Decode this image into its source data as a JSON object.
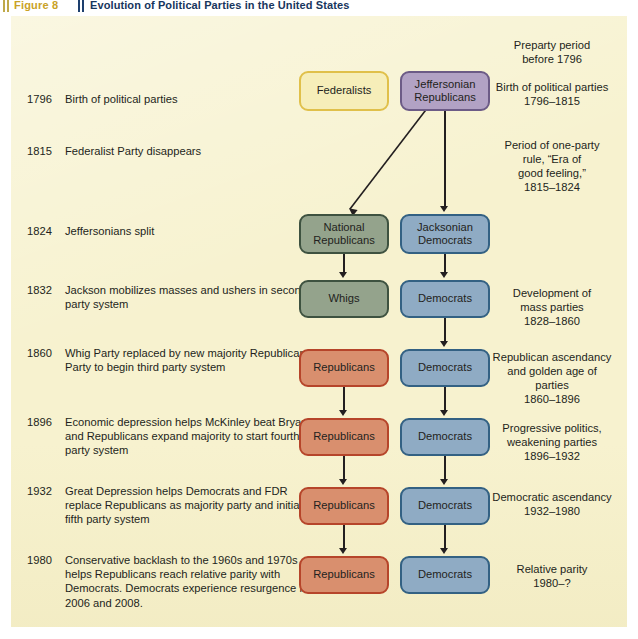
{
  "header": {
    "figure_label": "Figure 8",
    "title": "Evolution of Political Parties in the United States",
    "label_color": "#c9a227",
    "title_color": "#17365d"
  },
  "colors": {
    "canvas": "#f7f2cf",
    "federalists_fill": "#f6eeb9",
    "federalists_border": "#e0c04a",
    "jeffersonian_fill": "#b2a2c4",
    "jeffersonian_border": "#6c5b86",
    "green_fill": "#94a38c",
    "green_border": "#3e5240",
    "blue_fill": "#8fabc4",
    "blue_border": "#336183",
    "red_fill": "#d98f6e",
    "red_border": "#b6452a",
    "text": "#231f20"
  },
  "timeline": [
    {
      "year": "1796",
      "text": "Birth of political parties"
    },
    {
      "year": "1815",
      "text": "Federalist Party disappears"
    },
    {
      "year": "1824",
      "text": "Jeffersonians split"
    },
    {
      "year": "1832",
      "text": "Jackson mobilizes masses and ushers in second party system"
    },
    {
      "year": "1860",
      "text": "Whig Party replaced by new majority Republican Party to begin third party system"
    },
    {
      "year": "1896",
      "text": "Economic depression helps McKinley beat Bryan, and Republicans expand majority to start fourth party system"
    },
    {
      "year": "1932",
      "text": "Great Depression helps Democrats and FDR replace Republicans as majority party and initiates fifth party system"
    },
    {
      "year": "1980",
      "text": "Conservative backlash to the 1960s and 1970s helps Republicans reach relative parity with Democrats. Democrats experience resurgence in 2006 and 2008."
    }
  ],
  "annotations": [
    {
      "text": "Preparty period\nbefore 1796"
    },
    {
      "text": "Birth of political parties\n1796–1815"
    },
    {
      "text": "Period of one-party\nrule, “Era of\ngood feeling,”\n1815–1824"
    },
    {
      "text": "Development of\nmass parties\n1828–1860"
    },
    {
      "text": "Republican ascendancy\nand golden age of\nparties\n1860–1896"
    },
    {
      "text": "Progressive politics,\nweakening parties\n1896–1932"
    },
    {
      "text": "Democratic ascendancy\n1932–1980"
    },
    {
      "text": "Relative parity\n1980–?"
    }
  ],
  "boxes": {
    "federalists": "Federalists",
    "jeffersonian_republicans": "Jeffersonian\nRepublicans",
    "national_republicans": "National\nRepublicans",
    "jacksonian_democrats": "Jacksonian\nDemocrats",
    "whigs": "Whigs",
    "democrats_1832": "Democrats",
    "republicans_1860": "Republicans",
    "democrats_1860": "Democrats",
    "republicans_1896": "Republicans",
    "democrats_1896": "Democrats",
    "republicans_1932": "Republicans",
    "democrats_1932": "Democrats",
    "republicans_1980": "Republicans",
    "democrats_1980": "Democrats"
  }
}
